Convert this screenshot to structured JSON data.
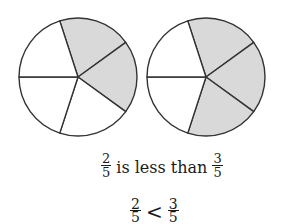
{
  "pies": [
    {
      "name": "two-fifths-pie",
      "cx": 78,
      "cy": 77,
      "r": 59,
      "slices": 5,
      "shaded": 2,
      "shaded_indices": [
        0,
        1
      ]
    },
    {
      "name": "three-fifths-pie",
      "cx": 206,
      "cy": 77,
      "r": 59,
      "slices": 5,
      "shaded": 3,
      "shaded_indices": [
        0,
        1,
        2
      ]
    }
  ],
  "colors": {
    "shade": "#d9d9d9",
    "stroke": "#333333",
    "background": "#ffffff"
  },
  "statement": {
    "left": {
      "numerator": "2",
      "denominator": "5"
    },
    "text": "is less than",
    "right": {
      "numerator": "3",
      "denominator": "5"
    }
  },
  "inequality": {
    "left": {
      "numerator": "2",
      "denominator": "5"
    },
    "operator": "<",
    "right": {
      "numerator": "3",
      "denominator": "5"
    }
  }
}
